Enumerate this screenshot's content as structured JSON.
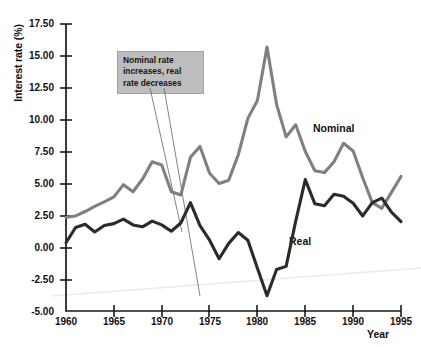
{
  "chart_data": {
    "type": "line",
    "title": "",
    "xlabel": "Year",
    "ylabel": "Interest rate (%)",
    "xlim": [
      1960,
      1995
    ],
    "ylim": [
      -5.0,
      17.5
    ],
    "grid": false,
    "legend_position": "inline-labels",
    "ytick_labels": [
      "17.50",
      "15.00",
      "12.50",
      "10.00",
      "7.50",
      "5.00",
      "2.50",
      "0.00",
      "-2.50",
      "-5.00"
    ],
    "ytick_values": [
      17.5,
      15.0,
      12.5,
      10.0,
      7.5,
      5.0,
      2.5,
      0.0,
      -2.5,
      -5.0
    ],
    "xtick_labels": [
      "1960",
      "1965",
      "1970",
      "1975",
      "1980",
      "1985",
      "1990",
      "1995"
    ],
    "xtick_values": [
      1960,
      1965,
      1970,
      1975,
      1980,
      1985,
      1990,
      1995
    ],
    "x": [
      1960,
      1961,
      1962,
      1963,
      1964,
      1965,
      1966,
      1967,
      1968,
      1969,
      1970,
      1971,
      1972,
      1973,
      1974,
      1975,
      1976,
      1977,
      1978,
      1979,
      1980,
      1981,
      1982,
      1983,
      1984,
      1985,
      1986,
      1987,
      1988,
      1989,
      1990,
      1991,
      1992,
      1993,
      1994,
      1995
    ],
    "series": [
      {
        "name": "Nominal",
        "color": "#808080",
        "values": [
          2.35,
          2.45,
          2.8,
          3.2,
          3.55,
          3.95,
          4.9,
          4.35,
          5.35,
          6.7,
          6.45,
          4.35,
          4.1,
          7.05,
          7.9,
          5.8,
          5.0,
          5.25,
          7.25,
          10.1,
          11.5,
          15.7,
          11.2,
          8.65,
          9.6,
          7.5,
          6.0,
          5.85,
          6.7,
          8.15,
          7.55,
          5.45,
          3.5,
          3.05,
          4.3,
          5.55
        ]
      },
      {
        "name": "Real",
        "color": "#2b2b2b",
        "values": [
          0.35,
          1.55,
          1.8,
          1.2,
          1.7,
          1.85,
          2.2,
          1.75,
          1.6,
          2.05,
          1.75,
          1.25,
          1.9,
          3.5,
          1.7,
          0.55,
          -0.9,
          0.3,
          1.15,
          0.55,
          -1.65,
          -3.8,
          -1.75,
          -1.5,
          2.05,
          5.3,
          3.4,
          3.25,
          4.15,
          4.0,
          3.45,
          2.45,
          3.5,
          3.85,
          2.75,
          2.0
        ]
      }
    ],
    "annotation": {
      "text": "Nominal rate increases, real rate decreases",
      "line1": "Nominal rate",
      "line2": "increases, real",
      "line3": "rate decreases",
      "background_color": "#bdbdbd"
    },
    "inline_labels": [
      {
        "name": "Nominal",
        "x_value": 1988,
        "y_value": 9.7
      },
      {
        "name": "Real",
        "x_value": 1985,
        "y_value": 0.6
      }
    ]
  }
}
